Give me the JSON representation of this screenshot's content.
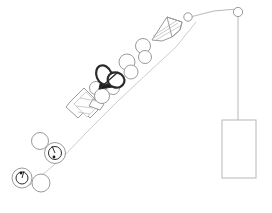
{
  "canvas": {
    "width": 272,
    "height": 213,
    "background": "#ffffff",
    "title": "technical line diagram"
  },
  "style": {
    "light_stroke": "#b8b8b8",
    "mid_stroke": "#9a9a9a",
    "dark_stroke": "#2b2b2b",
    "fill_none": "none",
    "fill_white": "#ffffff",
    "fill_dark": "#1a1a1a",
    "thin_width": "0.7",
    "normal_width": "1",
    "bold_width": "1.4"
  },
  "elements": {
    "guide_line": {
      "name": "main-diagonal-guide-line",
      "points": "30,185 60,160 88,131 118,101 150,71 176,47 196,22"
    },
    "top_link_line": {
      "name": "top-horizontal-link-line",
      "points": "190,17 214,11 237,9"
    },
    "hanger_line": {
      "name": "vertical-hanger-line",
      "x1": 238,
      "y1": 13,
      "x2": 238,
      "y2": 120
    },
    "pulley_small_left": {
      "name": "small-pulley-left",
      "cx": 188,
      "cy": 17,
      "r": 4.2
    },
    "pulley_small_right": {
      "name": "small-pulley-right",
      "cx": 238,
      "cy": 12,
      "r": 4.6
    },
    "weight_block": {
      "name": "suspended-weight-block",
      "x": 222,
      "y": 120,
      "width": 34,
      "height": 58
    },
    "cone": {
      "name": "cone-funnel-shape",
      "outline": "152,40 167,17 182,22 180,30 172,37 162,41",
      "rim": "167,17 182,22 180,30 172,37",
      "hatch": [
        {
          "x1": 154,
          "y1": 38,
          "x2": 178,
          "y2": 23
        },
        {
          "x1": 156,
          "y1": 40,
          "x2": 180,
          "y2": 26
        },
        {
          "x1": 153,
          "y1": 36,
          "x2": 176,
          "y2": 21
        }
      ]
    },
    "chain_circles": [
      {
        "name": "chain-circle-1",
        "cx": 143,
        "cy": 46,
        "r": 7.5
      },
      {
        "name": "chain-circle-2",
        "cx": 145,
        "cy": 57,
        "r": 6.5
      },
      {
        "name": "chain-circle-3",
        "cx": 127,
        "cy": 62,
        "r": 8.0
      },
      {
        "name": "chain-circle-4",
        "cx": 131,
        "cy": 72,
        "r": 7.0
      },
      {
        "name": "chain-circle-5",
        "cx": 111,
        "cy": 78,
        "r": 6.5
      },
      {
        "name": "chain-circle-6",
        "cx": 113,
        "cy": 88,
        "r": 6.5
      },
      {
        "name": "chain-circle-7",
        "cx": 96,
        "cy": 88,
        "r": 6.5
      },
      {
        "name": "chain-circle-8",
        "cx": 102,
        "cy": 96,
        "r": 7.5
      }
    ],
    "butterfly": {
      "name": "dark-butterfly-lobes-shape",
      "lobe_left": {
        "cx": 104,
        "cy": 75,
        "rx": 7.5,
        "ry": 10,
        "rotate": -22
      },
      "lobe_right": {
        "cx": 116,
        "cy": 80,
        "rx": 8.5,
        "ry": 7.5,
        "rotate": 18
      },
      "wedge": "99,89 104,66 120,86",
      "stem": "99,89 118,72"
    },
    "machine": {
      "name": "cylinder-machine-assembly",
      "body": "70,102 84,88 96,100 92,104 98,110 90,118 84,112 78,118 66,107",
      "barrel": "74,104 86,92 99,105 87,117",
      "nose": "93,99 104,104 100,110 89,106",
      "inner_lines": [
        {
          "x1": 76,
          "y1": 106,
          "x2": 93,
          "y2": 108
        },
        {
          "x1": 80,
          "y1": 98,
          "x2": 96,
          "y2": 101
        },
        {
          "x1": 78,
          "y1": 112,
          "x2": 90,
          "y2": 114
        }
      ]
    },
    "lower_circles": [
      {
        "name": "lower-plain-circle-1",
        "cx": 40,
        "cy": 141,
        "r": 8.5
      },
      {
        "name": "lower-plain-circle-2",
        "cx": 41,
        "cy": 183,
        "r": 9.0
      }
    ],
    "ring_gauges": [
      {
        "name": "ring-gauge-upper",
        "cx": 55,
        "cy": 153,
        "r_outer": 10.5,
        "r_inner": 6.5,
        "needle": {
          "x1": 55,
          "y1": 153,
          "x2": 52,
          "y2": 146
        },
        "dot": {
          "cx": 54,
          "cy": 157,
          "r": 1.4
        }
      },
      {
        "name": "ring-gauge-lower",
        "cx": 22,
        "cy": 178,
        "r_outer": 10.0,
        "r_inner": 6.0,
        "needle": {
          "x1": 22,
          "y1": 178,
          "x2": 24,
          "y2": 171
        },
        "dot": {
          "cx": 21,
          "cy": 173,
          "r": 1.4
        }
      }
    ]
  }
}
